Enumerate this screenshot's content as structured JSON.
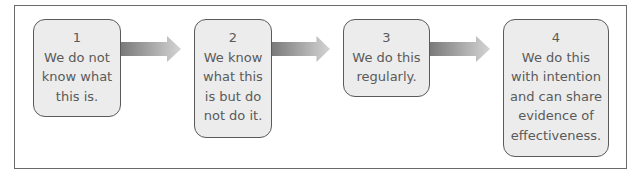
{
  "diagram": {
    "type": "process-flow",
    "stages": [
      {
        "number": "1",
        "text": "We do not\nknow what\nthis is."
      },
      {
        "number": "2",
        "text": "We know\nwhat this\nis but do\nnot do it."
      },
      {
        "number": "3",
        "text": "We do this\nregularly."
      },
      {
        "number": "4",
        "text": "We do this\nwith intention\nand can share\nevidence of\neffectiveness."
      }
    ],
    "colors": {
      "box_fill": "#ececec",
      "box_border": "#5a5a5a",
      "arrow_dark": "#7a7a7a",
      "arrow_light": "#d4d4d4",
      "text": "#5a5a5a"
    }
  }
}
